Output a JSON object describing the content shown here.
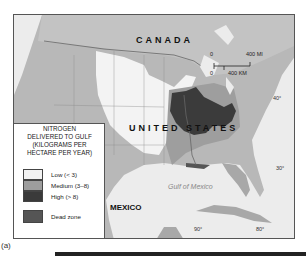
{
  "map": {
    "labels": {
      "canada": "CANADA",
      "united_states": "UNITED STATES",
      "mexico": "MEXICO",
      "gulf": "Gulf of Mexico"
    },
    "latitudes": [
      "40°",
      "30°"
    ],
    "longitudes": [
      "90°",
      "80°"
    ],
    "scale": {
      "zero_top": "0",
      "zero_bottom": "0",
      "miles": "400 MI",
      "km": "400 KM"
    },
    "colors": {
      "water": "#e9e9e9",
      "land_base": "#b5b5b5",
      "low": "#f2f2f2",
      "medium": "#9d9d9d",
      "high": "#3a3a3a",
      "dead_zone": "#555555"
    }
  },
  "legend": {
    "title_lines": [
      "NITROGEN",
      "DELIVERED TO GULF",
      "(KILOGRAMS PER",
      "HECTARE PER YEAR)"
    ],
    "items": [
      {
        "label": "Low (< 3)",
        "color": "#f2f2f2"
      },
      {
        "label": "Medium (3–8)",
        "color": "#9d9d9d"
      },
      {
        "label": "High (> 8)",
        "color": "#3a3a3a"
      },
      {
        "label": "Dead zone",
        "color": "#555555"
      }
    ]
  },
  "caption": "(a)"
}
